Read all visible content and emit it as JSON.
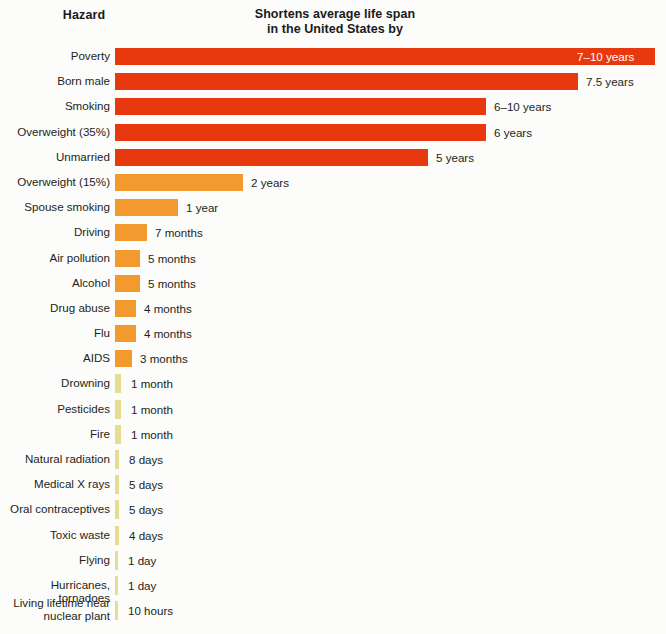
{
  "header": {
    "hazard_label": "Hazard",
    "title_line1": "Shortens average life span",
    "title_line2": "in the United States by"
  },
  "colors": {
    "red": "#E8380D",
    "orange": "#F29A2E",
    "pale_yellow": "#E6DC92",
    "background": "#FCFCFB",
    "text": "#231F20",
    "inbar_text": "#FFFFFF"
  },
  "chart_data": {
    "type": "bar",
    "orientation": "horizontal",
    "title": "Shortens average life span in the United States by",
    "xlabel": "",
    "ylabel": "Hazard",
    "grid": false,
    "legend": null,
    "value_unit": "time shortened from average life span",
    "categories": [
      "Poverty",
      "Born male",
      "Smoking",
      "Overweight (35%)",
      "Unmarried",
      "Overweight (15%)",
      "Spouse smoking",
      "Driving",
      "Air pollution",
      "Alcohol",
      "Drug abuse",
      "Flu",
      "AIDS",
      "Drowning",
      "Pesticides",
      "Fire",
      "Natural radiation",
      "Medical X rays",
      "Oral contraceptives",
      "Toxic waste",
      "Flying",
      "Hurricanes, tornadoes",
      "Living lifetime near\nnuclear plant"
    ],
    "value_labels": [
      "7–10 years",
      "7.5 years",
      "6–10 years",
      "6 years",
      "5 years",
      "2 years",
      "1 year",
      "7 months",
      "5 months",
      "5 months",
      "4 months",
      "4 months",
      "3 months",
      "1 month",
      "1 month",
      "1 month",
      "8 days",
      "5 days",
      "5 days",
      "4 days",
      "1 day",
      "1 day",
      "10 hours"
    ],
    "values_days": [
      3103,
      2738,
      2920,
      2190,
      1825,
      730,
      365,
      213,
      152,
      152,
      122,
      122,
      91,
      30,
      30,
      30,
      8,
      5,
      5,
      4,
      1,
      1,
      0.42
    ],
    "bar_pixel_widths": [
      540,
      463,
      371,
      371,
      313,
      128,
      63,
      32,
      25,
      25,
      21,
      21,
      17,
      6,
      6,
      6,
      4,
      4,
      4,
      4,
      3,
      3,
      3
    ],
    "bar_colors": [
      "#E8380D",
      "#E8380D",
      "#E8380D",
      "#E8380D",
      "#E8380D",
      "#F29A2E",
      "#F29A2E",
      "#F29A2E",
      "#F29A2E",
      "#F29A2E",
      "#F29A2E",
      "#F29A2E",
      "#F29A2E",
      "#E6DC92",
      "#E6DC92",
      "#E6DC92",
      "#E6DC92",
      "#E6DC92",
      "#E6DC92",
      "#E6DC92",
      "#E6DC92",
      "#E6DC92",
      "#E6DC92"
    ],
    "label_inside_bar": [
      true,
      false,
      false,
      false,
      false,
      false,
      false,
      false,
      false,
      false,
      false,
      false,
      false,
      false,
      false,
      false,
      false,
      false,
      false,
      false,
      false,
      false,
      false
    ]
  }
}
